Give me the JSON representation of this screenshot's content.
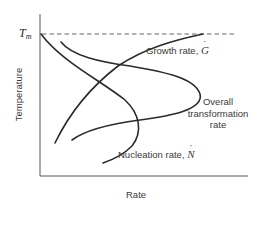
{
  "diagram": {
    "title": "",
    "axes": {
      "x_label": "Rate",
      "y_label": "Temperature",
      "y_marker": {
        "symbol": "T",
        "subscript": "m",
        "style": "dashed"
      }
    },
    "curves": [
      {
        "id": "nucleation",
        "label": "Nucleation rate,",
        "symbol": "N",
        "symbol_accent": "dot",
        "shape": "starts at zero at T_m, increases with undercooling to a maximum, then decreases"
      },
      {
        "id": "growth",
        "label": "Growth rate,",
        "symbol": "G",
        "symbol_accent": "dot",
        "shape": "zero at T_m, maximum at moderate undercooling, decreasing at low temperature"
      },
      {
        "id": "overall",
        "label_lines": [
          "Overall",
          "transformation",
          "rate"
        ],
        "shape": "C-shaped curve with nose at intermediate temperature (product of nucleation and growth)"
      }
    ],
    "colors": {
      "curve": "#2b2b2b",
      "axis": "#555555",
      "text": "#3a3a3a",
      "background": "#ffffff"
    }
  }
}
